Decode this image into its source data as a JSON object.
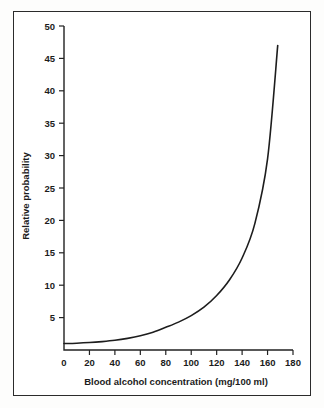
{
  "figure": {
    "background_color": "#fdfdfc",
    "frame_color": "#2b2b2b",
    "plot_background": "#ffffff"
  },
  "chart_data": {
    "type": "line",
    "title": "",
    "subtitle": "",
    "xlabel": "Blood alcohol concentration (mg/100 ml)",
    "ylabel": "Relative probability",
    "xlim": [
      0,
      180
    ],
    "ylim": [
      0,
      50
    ],
    "xticks": [
      0,
      20,
      40,
      60,
      80,
      100,
      120,
      140,
      160,
      180
    ],
    "yticks": [
      0,
      5,
      10,
      15,
      20,
      25,
      30,
      35,
      40,
      45,
      50
    ],
    "xtick_labels": [
      "0",
      "20",
      "40",
      "60",
      "80",
      "100",
      "120",
      "140",
      "160",
      "180"
    ],
    "ytick_labels": [
      "0",
      "5",
      "10",
      "15",
      "20",
      "25",
      "30",
      "35",
      "40",
      "45",
      "50"
    ],
    "grid": false,
    "legend": false,
    "legend_position": "none",
    "series": [
      {
        "name": "Relative probability of crash",
        "color": "#1d1d1d",
        "line_width": 1.6,
        "x": [
          0,
          10,
          20,
          30,
          40,
          50,
          60,
          70,
          80,
          90,
          100,
          110,
          120,
          130,
          140,
          150,
          160,
          168
        ],
        "y": [
          1.0,
          1.05,
          1.15,
          1.3,
          1.5,
          1.8,
          2.2,
          2.75,
          3.5,
          4.3,
          5.3,
          6.6,
          8.4,
          10.8,
          14.2,
          19.5,
          29.5,
          47.0
        ]
      }
    ],
    "annotations": []
  },
  "axes": {
    "x_axis_name": "x-axis",
    "y_axis_name": "y-axis"
  }
}
